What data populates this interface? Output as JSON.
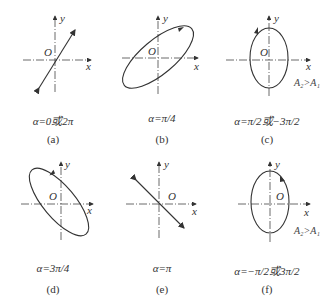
{
  "figure": {
    "axis_labels": {
      "x": "x",
      "y": "y",
      "origin": "O"
    },
    "panels": [
      {
        "id": "a",
        "label": "(a)",
        "alpha": "α=0或2π",
        "shape": "line",
        "slope": "positive"
      },
      {
        "id": "b",
        "label": "(b)",
        "alpha": "α=π/4",
        "shape": "ellipse",
        "tilt": "positive",
        "direction": "clockwise"
      },
      {
        "id": "c",
        "label": "(c)",
        "alpha": "α=π/2或−3π/2",
        "shape": "ellipse",
        "tilt": "vertical",
        "direction": "counterclockwise",
        "note": "A₂>A₁"
      },
      {
        "id": "d",
        "label": "(d)",
        "alpha": "α=3π/4",
        "shape": "ellipse",
        "tilt": "negative",
        "direction": "counterclockwise"
      },
      {
        "id": "e",
        "label": "(e)",
        "alpha": "α=π",
        "shape": "line",
        "slope": "negative"
      },
      {
        "id": "f",
        "label": "(f)",
        "alpha": "α=−π/2或3π/2",
        "shape": "ellipse",
        "tilt": "vertical",
        "direction": "clockwise",
        "note": "A₂>A₁"
      }
    ]
  }
}
